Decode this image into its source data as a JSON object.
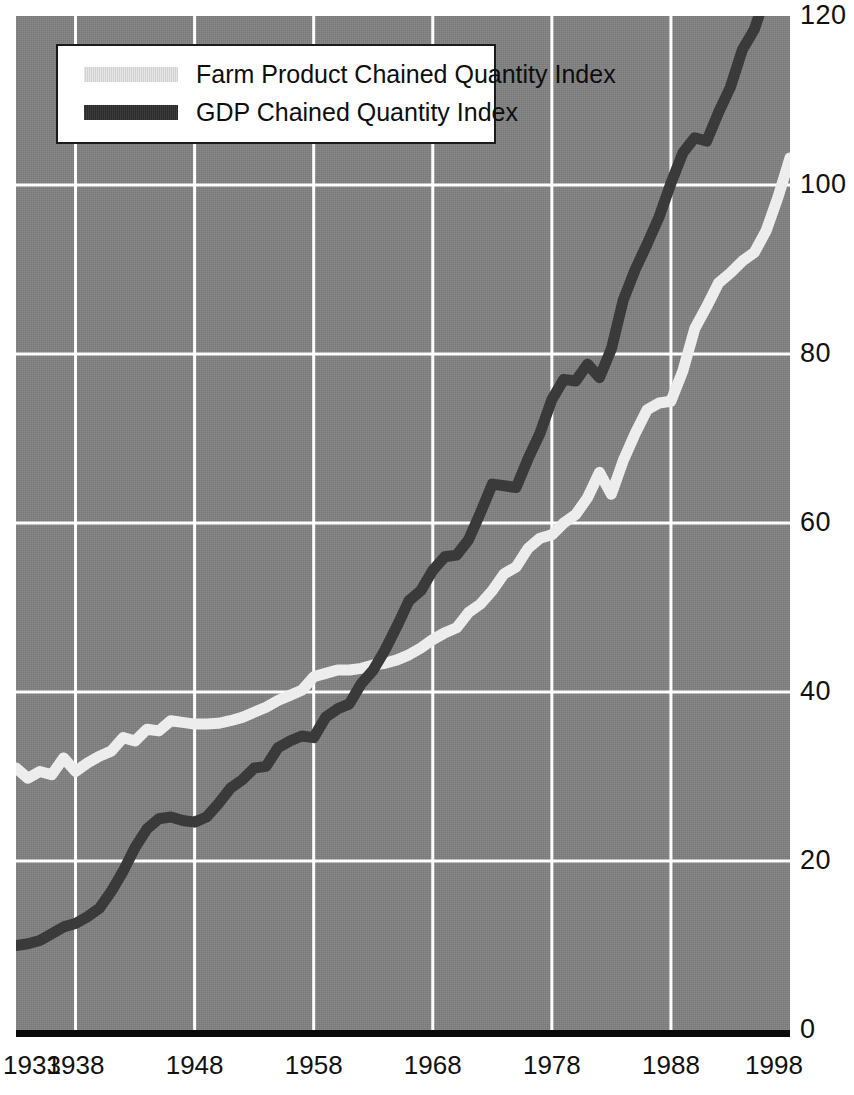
{
  "chart_data": {
    "type": "line",
    "title": "",
    "xlabel": "",
    "ylabel": "",
    "xlim": [
      1933,
      1998
    ],
    "ylim": [
      0,
      120
    ],
    "grid": true,
    "legend_position": "top-left",
    "x_tick_labels": [
      "1933",
      "1938",
      "1948",
      "1958",
      "1968",
      "1978",
      "1988",
      "1998"
    ],
    "x_ticks": [
      1933,
      1938,
      1948,
      1958,
      1968,
      1978,
      1988,
      1998
    ],
    "y_tick_labels": [
      "0",
      "20",
      "40",
      "60",
      "80",
      "100",
      "120"
    ],
    "y_ticks": [
      0,
      20,
      40,
      60,
      80,
      100,
      120
    ],
    "gridlines_x": [
      1938,
      1948,
      1958,
      1968,
      1978,
      1988
    ],
    "gridlines_y": [
      20,
      40,
      60,
      80,
      100
    ],
    "x": [
      1933,
      1934,
      1935,
      1936,
      1937,
      1938,
      1939,
      1940,
      1941,
      1942,
      1943,
      1944,
      1945,
      1946,
      1947,
      1948,
      1949,
      1950,
      1951,
      1952,
      1953,
      1954,
      1955,
      1956,
      1957,
      1958,
      1959,
      1960,
      1961,
      1962,
      1963,
      1964,
      1965,
      1966,
      1967,
      1968,
      1969,
      1970,
      1971,
      1972,
      1973,
      1974,
      1975,
      1976,
      1977,
      1978,
      1979,
      1980,
      1981,
      1982,
      1983,
      1984,
      1985,
      1986,
      1987,
      1988,
      1989,
      1990,
      1991,
      1992,
      1993,
      1994,
      1995,
      1996,
      1997,
      1998
    ],
    "series": [
      {
        "name": "Farm Product Chained Quantity Index",
        "color": "#ededed",
        "values": [
          31.0,
          29.8,
          30.6,
          30.2,
          32.2,
          30.6,
          31.6,
          32.4,
          33.0,
          34.6,
          34.2,
          35.6,
          35.4,
          36.6,
          36.4,
          36.2,
          36.2,
          36.3,
          36.6,
          37.0,
          37.6,
          38.2,
          39.0,
          39.6,
          40.2,
          41.8,
          42.2,
          42.6,
          42.6,
          42.8,
          43.2,
          43.4,
          43.8,
          44.4,
          45.2,
          46.2,
          47.0,
          47.6,
          49.4,
          50.4,
          52.0,
          54.0,
          54.8,
          57.0,
          58.2,
          58.6,
          60.0,
          61.0,
          63.0,
          66.0,
          63.4,
          67.4,
          70.6,
          73.4,
          74.2,
          74.4,
          78.0,
          83.0,
          85.6,
          88.4,
          89.6,
          91.0,
          92.0,
          94.6,
          98.6,
          103.2
        ]
      },
      {
        "name": "GDP Chained Quantity Index",
        "color": "#3a3a3a",
        "values": [
          10.0,
          10.2,
          10.6,
          11.4,
          12.2,
          12.6,
          13.4,
          14.4,
          16.4,
          18.8,
          21.6,
          23.8,
          25.0,
          25.2,
          24.8,
          24.6,
          25.2,
          26.8,
          28.6,
          29.6,
          31.0,
          31.2,
          33.4,
          34.2,
          34.8,
          34.6,
          37.0,
          38.0,
          38.6,
          41.0,
          42.6,
          45.0,
          47.8,
          50.8,
          52.0,
          54.4,
          56.0,
          56.2,
          58.0,
          61.2,
          64.6,
          64.4,
          64.2,
          67.6,
          70.6,
          74.6,
          77.0,
          76.8,
          78.8,
          77.2,
          80.6,
          86.4,
          90.0,
          93.0,
          96.2,
          100.2,
          103.8,
          105.6,
          105.2,
          108.6,
          111.6,
          116.0,
          118.4,
          122.6,
          127.4,
          132.0
        ]
      }
    ]
  },
  "legend": {
    "items": [
      {
        "label": "Farm Product Chained Quantity Index",
        "swatch": "farm"
      },
      {
        "label": "GDP Chained Quantity Index",
        "swatch": "gdp"
      }
    ]
  },
  "colors": {
    "plot_background": "#808080",
    "gridline": "#ffffff",
    "axis_rule": "#0a0a0a",
    "farm_line": "#ededed",
    "gdp_line": "#3a3a3a",
    "tick_text": "#111111",
    "legend_background": "#ffffff",
    "legend_border": "#1a1a1a"
  }
}
